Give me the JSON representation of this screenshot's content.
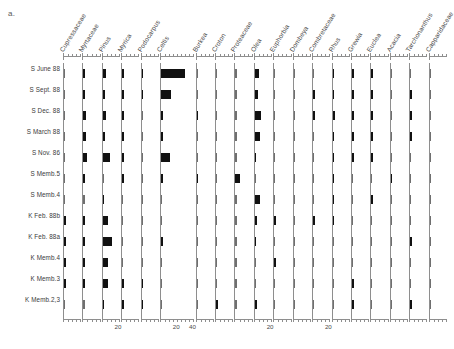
{
  "panel": {
    "letter": "a."
  },
  "chart_data": {
    "type": "bar",
    "title": "",
    "subtitle": "",
    "xlabel": "",
    "ylabel": "",
    "orientation": "horizontal",
    "layout": "pollen-percentage-diagram",
    "grid": false,
    "legend": null,
    "axis": {
      "units": "%",
      "tick_labels_shown": [
        "20",
        "20",
        "40",
        "20",
        "20",
        "20"
      ],
      "default_xlim": [
        0,
        20
      ],
      "note": "each taxon column has its own percentage axis; Celtis axis extends to 40"
    },
    "samples": [
      "S June 88",
      "S Sept. 88",
      "S Dec. 88",
      "S March 88",
      "S Nov. 86",
      "S Memb.5",
      "S Memb.4",
      "K Feb. 88b",
      "K Feb. 88a",
      "K Memb.4",
      "K Memb.3",
      "K Memb.2,3"
    ],
    "taxa": [
      "Cupressaceae",
      "Myrtaceae",
      "Pinus",
      "Myrica",
      "Podocarpus",
      "Celtis",
      "Burkea",
      "Croton",
      "Proteaceae",
      "Olea",
      "Euphorbia",
      "Dombeya",
      "Combretaceae",
      "Rhus",
      "Grewia",
      "Euclea",
      "Acacia",
      "Tarchonanthus",
      "Capparidaceae"
    ],
    "series": [
      {
        "name": "Cupressaceae",
        "xmax": 20,
        "values": [
          0.0,
          0.0,
          0.0,
          0.0,
          0.0,
          0.0,
          0.0,
          2.0,
          1.8,
          2.0,
          1.5,
          0.0
        ]
      },
      {
        "name": "Myrtaceae",
        "xmax": 20,
        "values": [
          2.0,
          1.8,
          3.0,
          3.0,
          5.0,
          0.6,
          0.0,
          2.0,
          2.0,
          2.5,
          2.5,
          0.0
        ]
      },
      {
        "name": "Pinus",
        "xmax": 20,
        "values": [
          4.0,
          3.0,
          3.5,
          3.0,
          9.0,
          0.0,
          1.5,
          6.0,
          11.0,
          6.0,
          7.0,
          1.5
        ]
      },
      {
        "name": "Myrica",
        "xmax": 20,
        "values": [
          0.6,
          1.5,
          1.5,
          1.5,
          0.6,
          1.5,
          0.0,
          0.0,
          0.0,
          0.0,
          0.8,
          0.8
        ]
      },
      {
        "name": "Podocarpus",
        "xmax": 20,
        "values": [
          0.6,
          1.5,
          0.0,
          0.0,
          0.0,
          0.0,
          0.0,
          0.0,
          0.0,
          0.0,
          0.8,
          0.6
        ]
      },
      {
        "name": "Celtis",
        "xmax": 40,
        "values": [
          30.0,
          12.0,
          2.0,
          1.5,
          11.0,
          1.0,
          0.0,
          0.0,
          1.0,
          0.0,
          0.0,
          0.0
        ]
      },
      {
        "name": "Burkea",
        "xmax": 20,
        "values": [
          0.0,
          0.0,
          2.0,
          0.0,
          0.0,
          2.0,
          0.0,
          0.0,
          0.0,
          0.0,
          0.0,
          0.0
        ]
      },
      {
        "name": "Croton",
        "xmax": 20,
        "values": [
          0.0,
          0.0,
          0.0,
          0.0,
          0.0,
          0.0,
          0.0,
          0.0,
          0.0,
          0.0,
          0.0,
          2.0
        ]
      },
      {
        "name": "Proteaceae",
        "xmax": 20,
        "values": [
          0.0,
          0.0,
          0.0,
          0.0,
          0.0,
          6.0,
          0.0,
          0.0,
          0.0,
          0.0,
          0.0,
          0.0
        ]
      },
      {
        "name": "Olea",
        "xmax": 20,
        "values": [
          5.0,
          3.5,
          7.0,
          6.0,
          1.0,
          0.0,
          6.0,
          2.0,
          1.0,
          0.0,
          0.0,
          3.0
        ]
      },
      {
        "name": "Euphorbia",
        "xmax": 20,
        "values": [
          0.0,
          0.0,
          0.0,
          0.0,
          0.0,
          0.0,
          0.0,
          1.0,
          0.0,
          2.0,
          0.0,
          0.0
        ]
      },
      {
        "name": "Dombeya",
        "xmax": 20,
        "values": [
          0.0,
          0.0,
          0.0,
          0.0,
          0.0,
          0.0,
          0.0,
          0.0,
          0.0,
          0.0,
          0.0,
          0.0
        ]
      },
      {
        "name": "Combretaceae",
        "xmax": 20,
        "values": [
          0.0,
          1.0,
          1.0,
          0.0,
          0.0,
          0.0,
          0.0,
          1.0,
          0.0,
          0.0,
          0.0,
          0.0
        ]
      },
      {
        "name": "Rhus",
        "xmax": 20,
        "values": [
          1.0,
          1.0,
          3.0,
          1.5,
          1.0,
          1.0,
          1.0,
          1.0,
          0.0,
          0.0,
          0.0,
          0.0
        ]
      },
      {
        "name": "Grewia",
        "xmax": 20,
        "values": [
          1.5,
          1.0,
          1.0,
          1.0,
          1.5,
          0.0,
          0.0,
          0.0,
          0.0,
          0.0,
          1.0,
          1.0
        ]
      },
      {
        "name": "Euclea",
        "xmax": 20,
        "values": [
          1.5,
          1.0,
          1.0,
          1.0,
          1.0,
          0.0,
          1.5,
          0.0,
          0.0,
          0.0,
          0.0,
          0.0
        ]
      },
      {
        "name": "Acacia",
        "xmax": 20,
        "values": [
          0.0,
          0.0,
          0.0,
          0.0,
          0.0,
          1.5,
          0.0,
          0.0,
          0.0,
          0.0,
          0.0,
          0.0
        ]
      },
      {
        "name": "Tarchonanthus",
        "xmax": 20,
        "values": [
          0.0,
          1.0,
          1.0,
          1.0,
          0.0,
          0.0,
          0.0,
          0.0,
          1.0,
          0.0,
          0.0,
          1.5
        ]
      },
      {
        "name": "Capparidaceae",
        "xmax": 20,
        "values": [
          0.0,
          0.0,
          0.0,
          0.0,
          0.0,
          0.0,
          0.0,
          0.0,
          0.0,
          0.0,
          0.0,
          0.0
        ]
      }
    ]
  },
  "colors": {
    "bar": "#111111",
    "axis": "#8e8e8e",
    "text": "#3a3a3a",
    "background": "#ffffff"
  }
}
